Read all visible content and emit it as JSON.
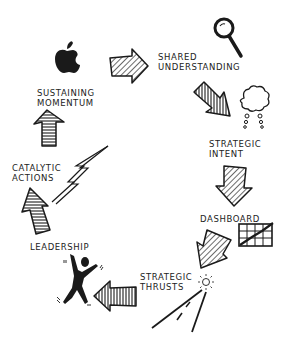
{
  "diagram": {
    "type": "cycle",
    "stages": [
      {
        "id": "shared-understanding",
        "line1": "Shared",
        "line2": "Understanding",
        "icon": "magnifying-glass-icon"
      },
      {
        "id": "strategic-intent",
        "line1": "Strategic",
        "line2": "Intent",
        "icon": "thought-cloud-icon"
      },
      {
        "id": "dashboard",
        "line1": "Dashboard",
        "line2": "",
        "icon": "chart-grid-icon"
      },
      {
        "id": "strategic-thrusts",
        "line1": "Strategic",
        "line2": "Thrusts",
        "icon": "road-icon"
      },
      {
        "id": "leadership",
        "line1": "Leadership",
        "line2": "",
        "icon": "person-icon"
      },
      {
        "id": "catalytic-actions",
        "line1": "Catalytic",
        "line2": "Actions",
        "icon": "lightning-icon"
      },
      {
        "id": "sustaining-momentum",
        "line1": "Sustaining",
        "line2": "Momentum",
        "icon": "apple-icon"
      }
    ],
    "colors": {
      "ink": "#1a1a1a",
      "background": "#ffffff"
    }
  }
}
